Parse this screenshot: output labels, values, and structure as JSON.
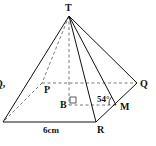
{
  "figure": {
    "type": "square-based pyramid",
    "vertices": {
      "apex": "T",
      "base_back_left": "P",
      "base_back_right": "Q",
      "base_front_right": "R",
      "base_front_left": ""
    },
    "points": {
      "center": "B",
      "midpoint": "M"
    },
    "labels": {
      "T": "T",
      "P": "P",
      "Q": "Q",
      "R": "R",
      "B": "B",
      "M": "M",
      "angle": "54°",
      "edge_length": "6cm",
      "left_cut_text": "Q,"
    },
    "measurements": {
      "angle_TMB_deg": 54,
      "base_edge_cm": 6
    },
    "colors": {
      "line": "#111111",
      "dashed": "#555555",
      "background": "#ffffff"
    }
  }
}
